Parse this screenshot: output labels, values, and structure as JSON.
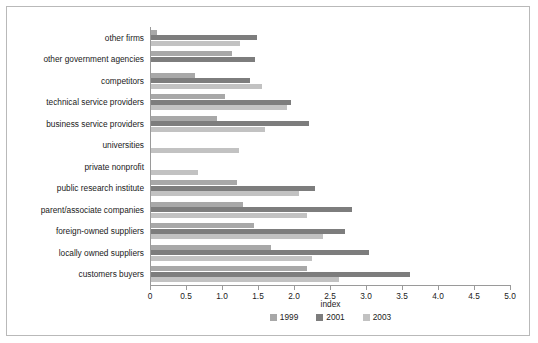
{
  "chart_data": {
    "type": "bar",
    "orientation": "horizontal",
    "title": "",
    "xlabel": "index",
    "ylabel": "",
    "xlim": [
      0,
      5.0
    ],
    "xticks": [
      "0",
      "0.5",
      "1.0",
      "1.5",
      "2.0",
      "2.5",
      "3.0",
      "3.5",
      "4.0",
      "4.5",
      "5.0"
    ],
    "xtick_values": [
      0,
      0.5,
      1.0,
      1.5,
      2.0,
      2.5,
      3.0,
      3.5,
      4.0,
      4.5,
      5.0
    ],
    "grid": false,
    "legend_position": "bottom",
    "categories": [
      "other firms",
      "other government agencies",
      "competitors",
      "technical service providers",
      "business service providers",
      "universities",
      "private nonprofit",
      "public research institute",
      "parent/associate companies",
      "foreign-owned suppliers",
      "locally owned suppliers",
      "customers buyers"
    ],
    "series": [
      {
        "name": "1999",
        "color": "#a8a8a8",
        "values": [
          0.1,
          1.14,
          0.63,
          1.04,
          0.93,
          0.0,
          0.0,
          1.21,
          1.29,
          1.44,
          1.68,
          2.18
        ]
      },
      {
        "name": "2001",
        "color": "#7d7d7d",
        "values": [
          1.49,
          1.46,
          1.39,
          1.96,
          2.21,
          0.0,
          0.0,
          2.29,
          2.8,
          2.71,
          3.04,
          3.61
        ]
      },
      {
        "name": "2003",
        "color": "#c2c2c2",
        "values": [
          1.25,
          0.0,
          1.56,
          1.9,
          1.6,
          1.24,
          0.66,
          2.07,
          2.18,
          2.4,
          2.25,
          2.63
        ]
      }
    ]
  },
  "legend": {
    "items": [
      {
        "label": "1999",
        "color": "#a8a8a8"
      },
      {
        "label": "2001",
        "color": "#7d7d7d"
      },
      {
        "label": "2003",
        "color": "#c2c2c2"
      }
    ]
  },
  "axis": {
    "x_title": "index"
  }
}
